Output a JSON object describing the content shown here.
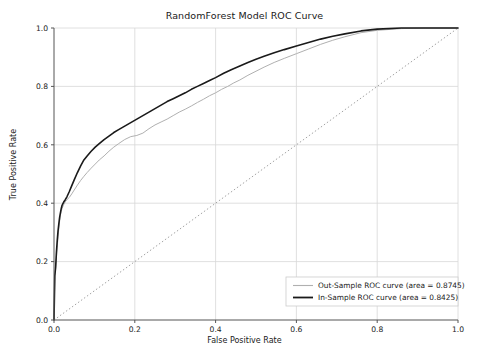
{
  "chart": {
    "title": "RandomForest Model ROC Curve",
    "xlabel": "False Positive Rate",
    "ylabel": "True Positive Rate"
  },
  "ticks": {
    "x": [
      "0.0",
      "0.2",
      "0.4",
      "0.6",
      "0.8",
      "1.0"
    ],
    "y": [
      "0.0",
      "0.2",
      "0.4",
      "0.6",
      "0.8",
      "1.0"
    ]
  },
  "legend": {
    "out_sample": "Out-Sample ROC curve (area = 0.8745)",
    "in_sample": "In-Sample ROC curve (area = 0.8425)"
  },
  "chart_data": {
    "type": "line",
    "title": "RandomForest Model ROC Curve",
    "xlabel": "False Positive Rate",
    "ylabel": "True Positive Rate",
    "xlim": [
      0.0,
      1.0
    ],
    "ylim": [
      0.0,
      1.0
    ],
    "grid": true,
    "legend_position": "lower right",
    "xticks": [
      0.0,
      0.2,
      0.4,
      0.6,
      0.8,
      1.0
    ],
    "yticks": [
      0.0,
      0.2,
      0.4,
      0.6,
      0.8,
      1.0
    ],
    "series": [
      {
        "name": "Out-Sample ROC curve (area = 0.8745)",
        "area": 0.8745,
        "color": "#b0b0b0",
        "linewidth": 1.0,
        "x": [
          0.0,
          0.002,
          0.004,
          0.005,
          0.006,
          0.008,
          0.01,
          0.012,
          0.014,
          0.016,
          0.018,
          0.02,
          0.024,
          0.028,
          0.032,
          0.038,
          0.044,
          0.05,
          0.058,
          0.066,
          0.074,
          0.082,
          0.092,
          0.102,
          0.112,
          0.124,
          0.136,
          0.148,
          0.16,
          0.175,
          0.19,
          0.205,
          0.22,
          0.235,
          0.25,
          0.265,
          0.28,
          0.295,
          0.31,
          0.325,
          0.34,
          0.355,
          0.37,
          0.385,
          0.4,
          0.415,
          0.43,
          0.445,
          0.46,
          0.48,
          0.5,
          0.52,
          0.545,
          0.57,
          0.6,
          0.63,
          0.66,
          0.69,
          0.72,
          0.76,
          0.8,
          0.86,
          0.92,
          1.0
        ],
        "y": [
          0.0,
          0.15,
          0.175,
          0.195,
          0.215,
          0.25,
          0.285,
          0.315,
          0.34,
          0.36,
          0.372,
          0.382,
          0.395,
          0.405,
          0.412,
          0.42,
          0.432,
          0.445,
          0.462,
          0.478,
          0.492,
          0.505,
          0.52,
          0.534,
          0.548,
          0.562,
          0.578,
          0.592,
          0.604,
          0.618,
          0.628,
          0.632,
          0.64,
          0.655,
          0.668,
          0.678,
          0.688,
          0.7,
          0.712,
          0.722,
          0.733,
          0.745,
          0.756,
          0.768,
          0.778,
          0.79,
          0.8,
          0.812,
          0.822,
          0.838,
          0.852,
          0.866,
          0.882,
          0.896,
          0.912,
          0.928,
          0.944,
          0.958,
          0.97,
          0.984,
          0.992,
          0.998,
          1.0,
          1.0
        ]
      },
      {
        "name": "In-Sample ROC curve (area = 0.8425)",
        "area": 0.8425,
        "color": "#1a1a1a",
        "linewidth": 1.6,
        "x": [
          0.0,
          0.002,
          0.004,
          0.005,
          0.006,
          0.008,
          0.01,
          0.012,
          0.014,
          0.016,
          0.018,
          0.02,
          0.024,
          0.028,
          0.032,
          0.038,
          0.044,
          0.05,
          0.058,
          0.066,
          0.074,
          0.082,
          0.092,
          0.102,
          0.112,
          0.124,
          0.136,
          0.148,
          0.16,
          0.175,
          0.19,
          0.205,
          0.22,
          0.235,
          0.25,
          0.265,
          0.28,
          0.295,
          0.31,
          0.325,
          0.34,
          0.355,
          0.37,
          0.385,
          0.4,
          0.42,
          0.44,
          0.46,
          0.48,
          0.5,
          0.52,
          0.545,
          0.57,
          0.6,
          0.63,
          0.66,
          0.69,
          0.72,
          0.76,
          0.8,
          0.86,
          0.92,
          1.0
        ],
        "y": [
          0.0,
          0.152,
          0.18,
          0.205,
          0.232,
          0.272,
          0.305,
          0.33,
          0.352,
          0.368,
          0.382,
          0.393,
          0.404,
          0.412,
          0.422,
          0.44,
          0.46,
          0.48,
          0.505,
          0.528,
          0.548,
          0.562,
          0.578,
          0.592,
          0.604,
          0.618,
          0.63,
          0.642,
          0.652,
          0.664,
          0.676,
          0.688,
          0.7,
          0.712,
          0.724,
          0.736,
          0.748,
          0.758,
          0.768,
          0.778,
          0.79,
          0.8,
          0.81,
          0.82,
          0.83,
          0.845,
          0.858,
          0.87,
          0.882,
          0.893,
          0.903,
          0.915,
          0.926,
          0.938,
          0.95,
          0.962,
          0.972,
          0.98,
          0.99,
          0.996,
          1.0,
          1.0,
          1.0
        ]
      }
    ],
    "reference_line": {
      "name": "chance-diagonal",
      "style": "dotted",
      "color": "#999999",
      "x": [
        0.0,
        1.0
      ],
      "y": [
        0.0,
        1.0
      ]
    }
  }
}
